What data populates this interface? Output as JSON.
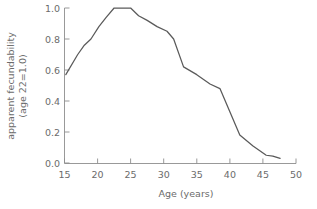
{
  "chart_data": {
    "type": "line",
    "title": "",
    "xlabel": "Age  (years)",
    "ylabel_line1": "apparent fecundability",
    "ylabel_line2": "(age 22=1.0)",
    "xlim": [
      15,
      50
    ],
    "ylim": [
      0.0,
      1.0
    ],
    "grid": false,
    "legend": null,
    "xticks": [
      15,
      20,
      25,
      30,
      35,
      40,
      45,
      50
    ],
    "xtick_labels": [
      "15",
      "20",
      "25",
      "30",
      "35",
      "40",
      "45",
      "50"
    ],
    "yticks": [
      0.0,
      0.2,
      0.4,
      0.6,
      0.8,
      1.0
    ],
    "ytick_labels": [
      "0.0",
      "0.2",
      "0.4",
      "0.6",
      "0.8",
      "1.0"
    ],
    "series": [
      {
        "name": "apparent fecundability",
        "color": "#5a5a5a",
        "x": [
          15.2,
          17.0,
          18.0,
          19.0,
          20.2,
          21.3,
          22.5,
          25.0,
          26.2,
          27.5,
          29.0,
          30.5,
          31.5,
          33.0,
          35.0,
          37.0,
          38.5,
          40.0,
          41.5,
          43.5,
          45.5,
          46.5,
          47.6
        ],
        "y": [
          0.57,
          0.7,
          0.76,
          0.8,
          0.88,
          0.94,
          1.0,
          1.0,
          0.95,
          0.92,
          0.88,
          0.85,
          0.8,
          0.62,
          0.57,
          0.51,
          0.48,
          0.33,
          0.18,
          0.11,
          0.05,
          0.045,
          0.03
        ]
      }
    ]
  },
  "axis_colors": {
    "axis": "#8d8d8d",
    "text": "#6b6b6b",
    "curve": "#5a5a5a",
    "background": "#ffffff"
  }
}
